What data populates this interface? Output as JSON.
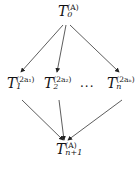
{
  "diagram": {
    "nodes": [
      {
        "id": "top",
        "base": "T",
        "sup": "(A)",
        "sub": "0"
      },
      {
        "id": "mid1",
        "base": "T",
        "sup": "(2a₁)",
        "sub": "1"
      },
      {
        "id": "mid2",
        "base": "T",
        "sup": "(2a₂)",
        "sub": "2"
      },
      {
        "id": "midn",
        "base": "T",
        "sup": "(2aₙ)",
        "sub": "n"
      },
      {
        "id": "bottom",
        "base": "T",
        "sup": "(A)",
        "sub": "n+1"
      }
    ],
    "ellipsis": "···",
    "edges": [
      {
        "from": "top",
        "to": "mid1"
      },
      {
        "from": "top",
        "to": "mid2"
      },
      {
        "from": "top",
        "to": "midn"
      },
      {
        "from": "mid1",
        "to": "bottom"
      },
      {
        "from": "mid2",
        "to": "bottom"
      },
      {
        "from": "midn",
        "to": "bottom"
      }
    ]
  }
}
